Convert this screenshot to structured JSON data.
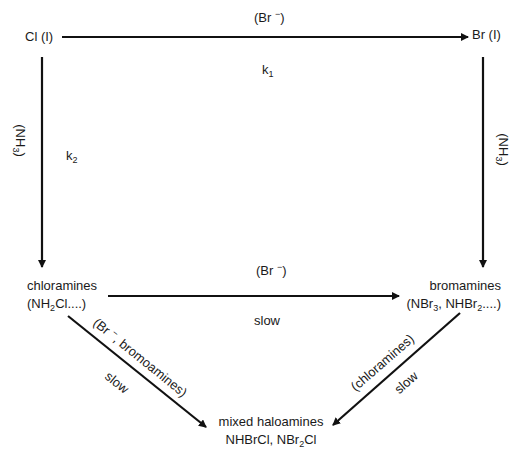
{
  "diagram": {
    "type": "reaction-scheme",
    "nodes": {
      "cl": {
        "label": "Cl (I)"
      },
      "br": {
        "label": "Br (I)"
      },
      "chloramines": {
        "line1": "chloramines",
        "line2_pre": "(NH",
        "line2_sub": "2",
        "line2_post": "Cl....)"
      },
      "bromamines": {
        "line1": "bromamines",
        "line2_a": "(NBr",
        "line2_sub1": "3",
        "line2_b": ", NHBr",
        "line2_sub2": "2",
        "line2_c": "....)"
      },
      "mixed": {
        "line1": "mixed haloamines",
        "line2_a": "NHBrCl, NBr",
        "line2_sub": "2",
        "line2_b": "Cl"
      }
    },
    "edges": {
      "cl_to_br": {
        "reagent_pre": "(Br ",
        "reagent_sup": "−",
        "reagent_post": ")",
        "rate_pre": "k",
        "rate_sub": "1"
      },
      "cl_to_chloramines": {
        "reagent_pre": "(NH",
        "reagent_sub": "3",
        "reagent_post": ")",
        "rate_pre": "k",
        "rate_sub": "2"
      },
      "br_to_bromamines": {
        "reagent_pre": "(NH",
        "reagent_sub": "3",
        "reagent_post": ")"
      },
      "chloramines_to_bromamines": {
        "reagent_pre": "(Br ",
        "reagent_sup": "−",
        "reagent_post": ")",
        "speed": "slow"
      },
      "chloramines_to_mixed": {
        "reagent_pre": "(Br ",
        "reagent_sup": "−",
        "reagent_post": ", bromoamines)",
        "speed": "slow"
      },
      "bromamines_to_mixed": {
        "reagent": "(chloramines)",
        "speed": "slow"
      }
    },
    "colors": {
      "line": "#111111",
      "text": "#1a1a1a",
      "background": "#ffffff"
    }
  }
}
